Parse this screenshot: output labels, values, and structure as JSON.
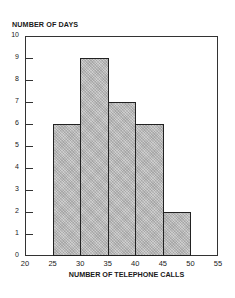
{
  "chart_data": {
    "type": "bar",
    "subtype": "histogram",
    "title": "",
    "xlabel": "NUMBER OF TELEPHONE CALLS",
    "ylabel": "NUMBER OF DAYS",
    "bins": [
      [
        25,
        30
      ],
      [
        30,
        35
      ],
      [
        35,
        40
      ],
      [
        40,
        45
      ],
      [
        45,
        50
      ]
    ],
    "categories": [
      "25-30",
      "30-35",
      "35-40",
      "40-45",
      "45-50"
    ],
    "values": [
      6,
      9,
      7,
      6,
      2
    ],
    "xlim": [
      20,
      55
    ],
    "ylim": [
      0,
      10
    ],
    "xticks": [
      "20",
      "25",
      "30",
      "35",
      "40",
      "45",
      "50",
      "55"
    ],
    "yticks": [
      "0",
      "1",
      "2",
      "3",
      "4",
      "5",
      "6",
      "7",
      "8",
      "9",
      "10"
    ],
    "grid": false,
    "legend": null,
    "bar_fill": "#bdbdbd",
    "bar_edge": "#222222"
  }
}
